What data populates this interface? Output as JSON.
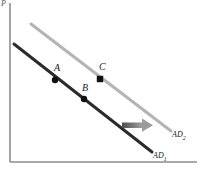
{
  "figure": {
    "background_color": "#ffffff",
    "axis_color": "#8c8c8c",
    "price_axis_label": "P"
  },
  "chart_data": {
    "type": "line",
    "title": "",
    "xlabel": "",
    "ylabel": "",
    "grid": false,
    "legend_position": "inline-right",
    "xlim": [
      0,
      200
    ],
    "ylim": [
      0,
      169
    ],
    "axes": {
      "vertical": {
        "x": 10,
        "y_top": 3,
        "y_bottom": 162,
        "color": "#8c8c8c"
      },
      "horizontal": {
        "y": 162,
        "x_left": 10,
        "x_right": 197,
        "color": "#8c8c8c"
      }
    },
    "series": [
      {
        "name": "AD₁",
        "label_text": "AD",
        "label_sub": "1",
        "color": "#2b2b2b",
        "width": 3,
        "x": [
          14,
          152
        ],
        "y": [
          44,
          152
        ],
        "label_x": 153,
        "label_y": 152
      },
      {
        "name": "AD₂",
        "label_text": "AD",
        "label_sub": "2",
        "color": "#b4b4b4",
        "width": 3,
        "x": [
          31,
          171
        ],
        "y": [
          24,
          131
        ],
        "label_x": 172,
        "label_y": 131
      }
    ],
    "points": [
      {
        "name": "A",
        "label": "A",
        "x": 55,
        "y": 80,
        "on_curve": "AD₁",
        "color": "#111111",
        "radius": 3,
        "label_x": 54,
        "label_y": 63
      },
      {
        "name": "B",
        "label": "B",
        "x": 84,
        "y": 99,
        "on_curve": "AD₁",
        "color": "#111111",
        "radius": 3,
        "label_x": 82,
        "label_y": 83
      },
      {
        "name": "C",
        "label": "C",
        "x": 100,
        "y": 79,
        "on_curve": "AD₂",
        "color": "#111111",
        "radius": 3,
        "label_x": 99,
        "label_y": 62
      }
    ],
    "annotations": [
      {
        "name": "shift-arrow",
        "type": "arrow",
        "direction": "right",
        "x_start": 122,
        "x_end": 152,
        "y": 125,
        "color_start": "#4d4d4d",
        "color_end": "#a8a8a8"
      }
    ]
  }
}
